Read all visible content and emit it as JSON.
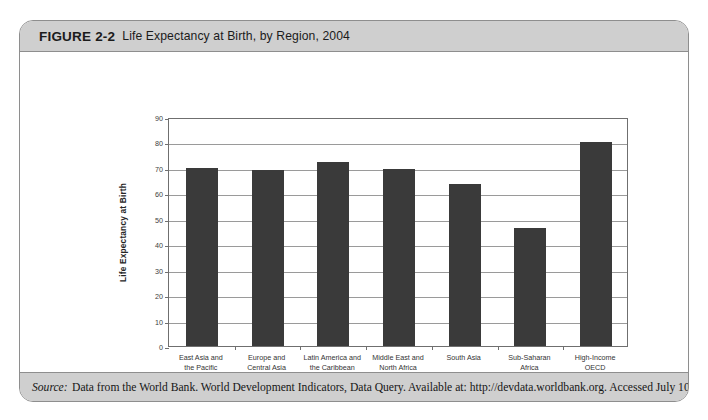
{
  "figure": {
    "label": "FIGURE 2-2",
    "title": "Life Expectancy at Birth, by Region, 2004",
    "source_label": "Source:",
    "source_text": "Data from the World Bank. World Development Indicators, Data Query. Available at: http://devdata.worldbank.org. Accessed July 10, 2006."
  },
  "chart_data": {
    "type": "bar",
    "title": "Life Expectancy at Birth, by Region, 2004",
    "xlabel": "REGION/GROUP",
    "ylabel": "Life Expectancy at Birth",
    "ylim": [
      0,
      90
    ],
    "ytick_step": 10,
    "yticks": [
      0,
      10,
      20,
      30,
      40,
      50,
      60,
      70,
      80,
      90
    ],
    "grid": true,
    "legend": "none",
    "bar_color": "#3a3a3a",
    "categories": [
      "East Asia and the Pacific",
      "Europe and Central Asia",
      "Latin America and the Caribbean",
      "Middle East and North Africa",
      "South Asia",
      "Sub-Saharan Africa",
      "High-Income OECD"
    ],
    "category_lines": [
      [
        "East Asia and",
        "the Pacific"
      ],
      [
        "Europe and",
        "Central Asia"
      ],
      [
        "Latin America and",
        "the Caribbean"
      ],
      [
        "Middle East and",
        "North Africa"
      ],
      [
        "South Asia"
      ],
      [
        "Sub-Saharan",
        "Africa"
      ],
      [
        "High-Income",
        "OECD"
      ]
    ],
    "values": [
      70,
      69,
      72.5,
      69.5,
      63.5,
      46.5,
      80
    ]
  }
}
